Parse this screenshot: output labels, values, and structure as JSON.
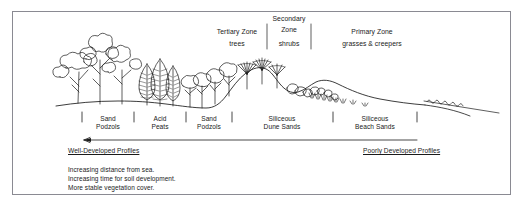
{
  "figure": {
    "type": "coastal-dune-succession-cross-section",
    "border_color": "#8a8a92",
    "line_color": "#1a1a1a"
  },
  "zones": [
    {
      "id": "tertiary",
      "title": "Tertiary Zone",
      "subtitle": "trees",
      "x": 237,
      "title_y": 28,
      "subtitle_y": 40,
      "bracket": false
    },
    {
      "id": "secondary",
      "title_line1": "Secondary",
      "title_line2": "Zone",
      "subtitle": "shrubs",
      "x": 289,
      "title_y": 15,
      "bracket": true,
      "bracket_left_x": 267,
      "bracket_right_x": 311,
      "bracket_top_y": 24,
      "bracket_bottom_y": 49
    },
    {
      "id": "primary",
      "title": "Primary Zone",
      "subtitle": "grasses & creepers",
      "x": 372,
      "title_y": 28,
      "subtitle_y": 40,
      "bracket": false
    }
  ],
  "soil_units": [
    {
      "label_line1": "Sand",
      "label_line2": "Podzols",
      "center_x": 108
    },
    {
      "label_line1": "Acid",
      "label_line2": "Peats",
      "center_x": 160
    },
    {
      "label_line1": "Sand",
      "label_line2": "Podzols",
      "center_x": 209
    },
    {
      "label_line1": "Siliceous",
      "label_line2": "Dune Sands",
      "center_x": 282
    },
    {
      "label_line1": "Siliceous",
      "label_line2": "Beach Sands",
      "center_x": 375
    }
  ],
  "soil_tick_positions": [
    82,
    134,
    186,
    232,
    333,
    417
  ],
  "soil_label_y": 116,
  "soil_label_y2": 124,
  "gradient_arrow": {
    "y": 140,
    "x_start": 417,
    "x_end": 82,
    "direction": "left",
    "left_caption": "Well-Developed Profiles",
    "left_caption_x": 68,
    "right_caption": "Poorly Developed Profiles",
    "right_caption_x": 363,
    "caption_y": 148
  },
  "notes": {
    "lines": [
      "Increasing distance from sea.",
      "Increasing time for soil development.",
      "More stable vegetation cover."
    ],
    "x": 68,
    "y": 166
  }
}
